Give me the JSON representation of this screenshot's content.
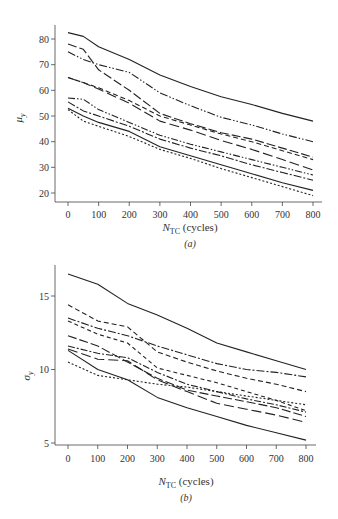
{
  "chart_data": [
    {
      "type": "line",
      "panel": "(a)",
      "title": "",
      "xlabel": "N_TC (cycles)",
      "ylabel": "μ_y",
      "xlim": [
        0,
        800
      ],
      "ylim": [
        18,
        84
      ],
      "x_ticks": [
        0,
        100,
        200,
        300,
        400,
        500,
        600,
        700,
        800
      ],
      "y_ticks": [
        20,
        30,
        40,
        50,
        60,
        70,
        80
      ],
      "grid": false,
      "legend": "none",
      "x": [
        0,
        50,
        100,
        200,
        300,
        400,
        500,
        600,
        700,
        800
      ],
      "series": [
        {
          "name": "series-1",
          "style": "solid",
          "values": [
            82.5,
            81,
            77,
            72,
            66,
            61.5,
            57.5,
            54.5,
            51,
            48
          ]
        },
        {
          "name": "series-2",
          "style": "dash-dot-dot",
          "values": [
            75,
            72,
            70,
            67,
            59,
            54,
            49.5,
            46.5,
            43,
            40
          ]
        },
        {
          "name": "series-3",
          "style": "long-dash",
          "values": [
            78,
            76,
            68,
            60,
            51,
            47,
            43.5,
            41,
            37.5,
            34
          ]
        },
        {
          "name": "series-4",
          "style": "dashed",
          "values": [
            65,
            63,
            61,
            56,
            50,
            46.5,
            43,
            40,
            36.5,
            33
          ]
        },
        {
          "name": "series-5",
          "style": "long-dash-2",
          "values": [
            65,
            63,
            60.5,
            55,
            48,
            44.5,
            40.5,
            37,
            33,
            29
          ]
        },
        {
          "name": "series-6",
          "style": "dash-dot-dot-2",
          "values": [
            57,
            56.5,
            52.5,
            47.5,
            42.5,
            39,
            36,
            33,
            30,
            27
          ]
        },
        {
          "name": "series-7",
          "style": "dash-dot",
          "values": [
            55.5,
            52,
            50,
            46,
            41,
            37.5,
            34.5,
            31,
            28,
            25
          ]
        },
        {
          "name": "series-8",
          "style": "solid-2",
          "values": [
            53,
            50,
            47.5,
            44,
            38,
            34.5,
            31,
            27.5,
            24,
            21
          ]
        },
        {
          "name": "series-9",
          "style": "dotted",
          "values": [
            52.5,
            48,
            46,
            42,
            37,
            33.5,
            29.5,
            26,
            22.5,
            19
          ]
        }
      ]
    },
    {
      "type": "line",
      "panel": "(b)",
      "title": "",
      "xlabel": "N_TC (cycles)",
      "ylabel": "σ_y",
      "xlim": [
        0,
        800
      ],
      "ylim": [
        4.8,
        17
      ],
      "x_ticks": [
        0,
        100,
        200,
        300,
        400,
        500,
        600,
        700,
        800
      ],
      "y_ticks": [
        5,
        10,
        15
      ],
      "grid": false,
      "legend": "none",
      "x": [
        0,
        100,
        200,
        300,
        400,
        500,
        600,
        700,
        800
      ],
      "series": [
        {
          "name": "series-1",
          "style": "solid",
          "values": [
            16.5,
            15.8,
            14.5,
            13.7,
            12.8,
            11.8,
            11.2,
            10.6,
            10.0
          ]
        },
        {
          "name": "series-2",
          "style": "dashed",
          "values": [
            14.4,
            13.3,
            12.9,
            11.2,
            10.5,
            9.9,
            9.4,
            9.0,
            8.5
          ]
        },
        {
          "name": "series-3",
          "style": "dash-dot",
          "values": [
            13.5,
            12.8,
            12.3,
            11.6,
            11.0,
            10.4,
            10.0,
            9.8,
            9.5
          ]
        },
        {
          "name": "series-4",
          "style": "dashed-2",
          "values": [
            13.3,
            12.4,
            11.8,
            10.1,
            9.6,
            9.1,
            8.5,
            7.9,
            7.2
          ]
        },
        {
          "name": "series-5",
          "style": "long-dash",
          "values": [
            12.3,
            11.6,
            10.5,
            9.4,
            8.6,
            8.2,
            7.8,
            7.4,
            6.8
          ]
        },
        {
          "name": "series-6",
          "style": "dash-dot-2",
          "values": [
            11.6,
            11.1,
            10.8,
            9.8,
            9.0,
            8.5,
            8.0,
            7.6,
            7.1
          ]
        },
        {
          "name": "series-7",
          "style": "long-dash-2",
          "values": [
            11.4,
            10.7,
            10.6,
            9.3,
            8.5,
            7.7,
            7.3,
            6.9,
            6.4
          ]
        },
        {
          "name": "series-8",
          "style": "dotted",
          "values": [
            10.5,
            9.6,
            9.3,
            9.0,
            8.8,
            8.5,
            8.2,
            7.9,
            7.6
          ]
        },
        {
          "name": "series-9",
          "style": "solid-2",
          "values": [
            11.3,
            10.0,
            9.3,
            8.1,
            7.4,
            6.8,
            6.2,
            5.7,
            5.2
          ]
        }
      ]
    }
  ],
  "figure": {
    "panel_a": {
      "ylabel_main": "μ",
      "ylabel_sub": "y",
      "xlabel_main": "N",
      "xlabel_sub": "TC",
      "xlabel_rest": " (cycles)",
      "caption": "(a)"
    },
    "panel_b": {
      "ylabel_main": "σ",
      "ylabel_sub": "y",
      "xlabel_main": "N",
      "xlabel_sub": "TC",
      "xlabel_rest": " (cycles)",
      "caption": "(b)"
    }
  }
}
